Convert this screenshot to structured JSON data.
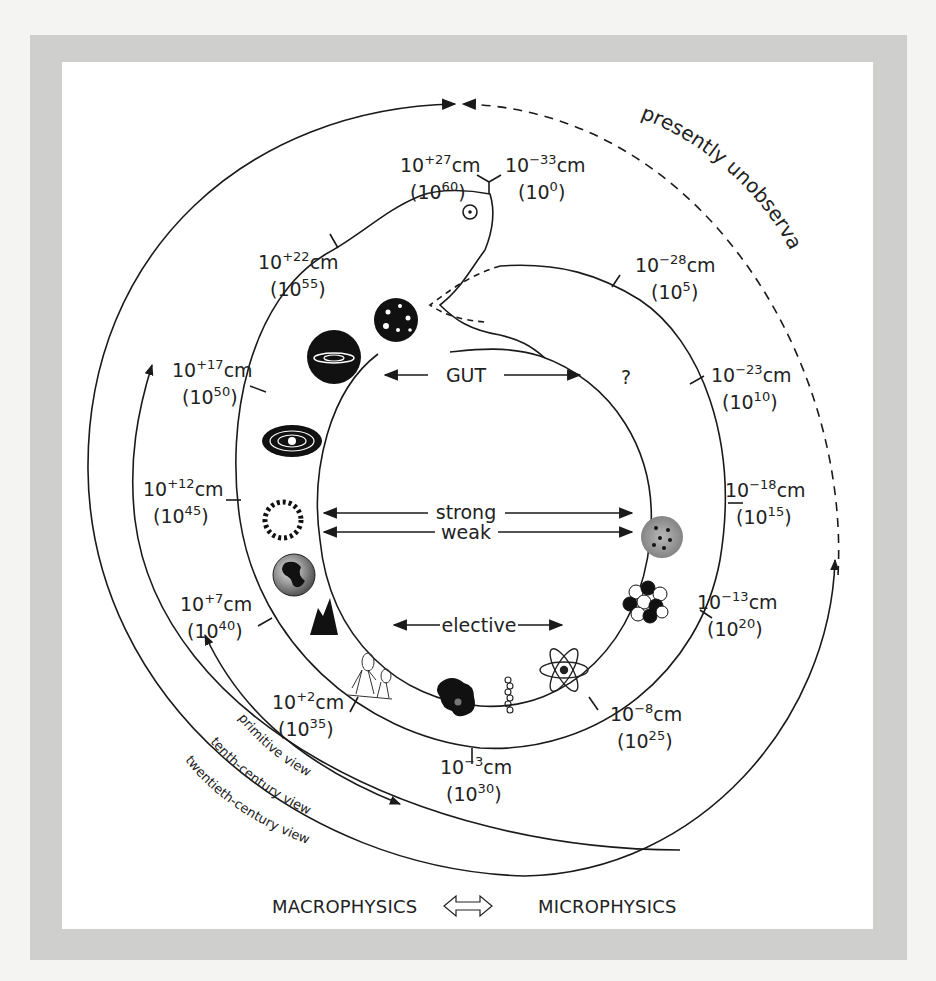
{
  "figure": {
    "colors": {
      "frame": "#cfcfcd",
      "panel": "#ffffff",
      "ink": "#1a1a1a"
    }
  },
  "scale_labels": [
    {
      "id": "s27p",
      "base": "10",
      "exp": "+27",
      "unit": "cm",
      "paren_base": "10",
      "paren_exp": "60"
    },
    {
      "id": "s33m",
      "base": "10",
      "exp": "−33",
      "unit": "cm",
      "paren_base": "10",
      "paren_exp": "0"
    },
    {
      "id": "s22p",
      "base": "10",
      "exp": "+22",
      "unit": "cm",
      "paren_base": "10",
      "paren_exp": "55"
    },
    {
      "id": "s28m",
      "base": "10",
      "exp": "−28",
      "unit": "cm",
      "paren_base": "10",
      "paren_exp": "5"
    },
    {
      "id": "s17p",
      "base": "10",
      "exp": "+17",
      "unit": "cm",
      "paren_base": "10",
      "paren_exp": "50"
    },
    {
      "id": "s23m",
      "base": "10",
      "exp": "−23",
      "unit": "cm",
      "paren_base": "10",
      "paren_exp": "10"
    },
    {
      "id": "s12p",
      "base": "10",
      "exp": "+12",
      "unit": "cm",
      "paren_base": "10",
      "paren_exp": "45"
    },
    {
      "id": "s18m",
      "base": "10",
      "exp": "−18",
      "unit": "cm",
      "paren_base": "10",
      "paren_exp": "15"
    },
    {
      "id": "s7p",
      "base": "10",
      "exp": "+7",
      "unit": "cm",
      "paren_base": "10",
      "paren_exp": "40"
    },
    {
      "id": "s13m",
      "base": "10",
      "exp": "−13",
      "unit": "cm",
      "paren_base": "10",
      "paren_exp": "20"
    },
    {
      "id": "s2p",
      "base": "10",
      "exp": "+2",
      "unit": "cm",
      "paren_base": "10",
      "paren_exp": "35"
    },
    {
      "id": "s8m",
      "base": "10",
      "exp": "−8",
      "unit": "cm",
      "paren_base": "10",
      "paren_exp": "25"
    },
    {
      "id": "s3m",
      "base": "10",
      "exp": "−3",
      "unit": "cm",
      "paren_base": "10",
      "paren_exp": "30"
    }
  ],
  "forces": {
    "gut": "GUT",
    "unknown": "?",
    "strong": "strong",
    "weak": "weak",
    "elective": "elective"
  },
  "views": {
    "primitive": "primitive view",
    "tenth": "tenth-century view",
    "twentieth": "twentieth-century view"
  },
  "annotations": {
    "unobservable": "presently unobservable"
  },
  "footer": {
    "macro": "MACROPHYSICS",
    "micro": "MICROPHYSICS",
    "double_arrow": "⟺"
  },
  "icons": [
    "universe-cluster-icon",
    "galaxy-icon",
    "solar-system-icon",
    "sun-icon",
    "earth-icon",
    "mountain-icon",
    "humans-icon",
    "cell-icon",
    "dna-icon",
    "atom-icon",
    "nucleus-icon",
    "proton-icon",
    "snake-eye-icon",
    "snake-tongue-icon"
  ]
}
